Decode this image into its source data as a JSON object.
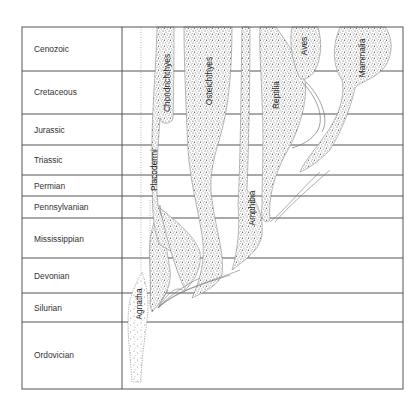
{
  "diagram": {
    "type": "phylogenetic-timeline",
    "periods": [
      {
        "name": "Cenozoic",
        "top": 27,
        "bottom": 71
      },
      {
        "name": "Cretaceous",
        "top": 71,
        "bottom": 114
      },
      {
        "name": "Jurassic",
        "top": 114,
        "bottom": 145
      },
      {
        "name": "Triassic",
        "top": 145,
        "bottom": 175
      },
      {
        "name": "Permian",
        "top": 175,
        "bottom": 196
      },
      {
        "name": "Pennsylvanian",
        "top": 196,
        "bottom": 218
      },
      {
        "name": "Mississippian",
        "top": 218,
        "bottom": 258
      },
      {
        "name": "Devonian",
        "top": 258,
        "bottom": 293
      },
      {
        "name": "Silurian",
        "top": 293,
        "bottom": 322
      },
      {
        "name": "Ordovician",
        "top": 322,
        "bottom": 389
      }
    ],
    "taxa": [
      {
        "name": "Agnatha",
        "x": 139,
        "y": 304
      },
      {
        "name": "Placodermi",
        "x": 154,
        "y": 170
      },
      {
        "name": "Chondrichthyes",
        "x": 167,
        "y": 83
      },
      {
        "name": "Osteichthyes",
        "x": 209,
        "y": 81
      },
      {
        "name": "Amphibia",
        "x": 252,
        "y": 208
      },
      {
        "name": "Reptilia",
        "x": 276,
        "y": 95
      },
      {
        "name": "Aves",
        "x": 304,
        "y": 46
      },
      {
        "name": "Mammalia",
        "x": 362,
        "y": 58
      }
    ],
    "colors": {
      "line": "#555555",
      "stipple": "#6a6a6a",
      "text": "#333333"
    }
  }
}
